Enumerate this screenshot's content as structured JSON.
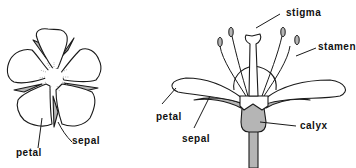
{
  "diagram": {
    "type": "flower-anatomy",
    "colors": {
      "outline": "#1a1a1a",
      "fill_white": "#ffffff",
      "fill_gray": "#b5b5b5",
      "pollen_dots": "#9a9a9a"
    },
    "top_view": {
      "description": "Five-petaled flower seen from above with sepals between petals",
      "labels": {
        "petal": "petal",
        "sepal": "sepal"
      }
    },
    "side_view": {
      "description": "Cross-section side view of flower showing reproductive parts",
      "labels": {
        "stigma": "stigma",
        "stamen": "stamen",
        "petal": "petal",
        "sepal": "sepal",
        "calyx": "calyx"
      }
    }
  }
}
